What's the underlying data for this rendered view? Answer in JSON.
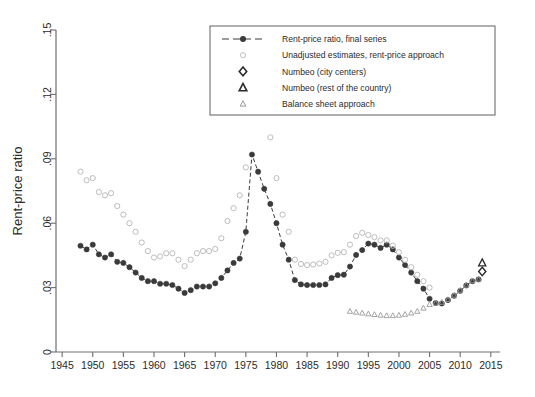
{
  "chart_data": {
    "type": "line",
    "title": "",
    "xlabel": "",
    "ylabel": "Rent-price ratio",
    "xlim": [
      1944,
      2016.5
    ],
    "ylim": [
      0,
      0.15
    ],
    "xticks": [
      1945,
      1950,
      1955,
      1960,
      1965,
      1970,
      1975,
      1980,
      1985,
      1990,
      1995,
      2000,
      2005,
      2010,
      2015
    ],
    "yticks": [
      0,
      0.03,
      0.06,
      0.09,
      0.12,
      0.15
    ],
    "ytick_labels": [
      "0",
      ".03",
      ".06",
      ".09",
      ".12",
      ".15"
    ],
    "grid": false,
    "legend_position": "top-right",
    "series": [
      {
        "name": "Rent-price ratio, final series",
        "marker": "filled-circle",
        "color": "#3a3a3a",
        "line": "dashed",
        "x": [
          1948,
          1949,
          1950,
          1951,
          1952,
          1953,
          1954,
          1955,
          1956,
          1957,
          1958,
          1959,
          1960,
          1961,
          1962,
          1963,
          1964,
          1965,
          1966,
          1967,
          1968,
          1969,
          1970,
          1971,
          1972,
          1973,
          1974,
          1975,
          1976,
          1977,
          1978,
          1979,
          1980,
          1981,
          1982,
          1983,
          1984,
          1985,
          1986,
          1987,
          1988,
          1989,
          1990,
          1991,
          1992,
          1993,
          1994,
          1995,
          1996,
          1997,
          1998,
          1999,
          2000,
          2001,
          2002,
          2003,
          2004,
          2005,
          2006,
          2007,
          2008,
          2009,
          2010,
          2011,
          2012,
          2013
        ],
        "values": [
          0.0495,
          0.0478,
          0.05,
          0.0455,
          0.044,
          0.0455,
          0.042,
          0.0415,
          0.0395,
          0.037,
          0.0345,
          0.033,
          0.033,
          0.0318,
          0.0318,
          0.0312,
          0.0295,
          0.0275,
          0.0288,
          0.0305,
          0.0305,
          0.0305,
          0.032,
          0.0345,
          0.038,
          0.0415,
          0.0435,
          0.056,
          0.092,
          0.084,
          0.076,
          0.069,
          0.06,
          0.05,
          0.043,
          0.0335,
          0.0315,
          0.0312,
          0.0312,
          0.0312,
          0.0315,
          0.0345,
          0.0358,
          0.036,
          0.0398,
          0.0452,
          0.0475,
          0.0505,
          0.05,
          0.0485,
          0.05,
          0.0478,
          0.044,
          0.0405,
          0.037,
          0.033,
          0.0295,
          0.0248,
          0.0228,
          0.0226,
          0.0242,
          0.0262,
          0.0285,
          0.031,
          0.033,
          0.0338
        ]
      },
      {
        "name": "Unadjusted estimates, rent-price approach",
        "marker": "hollow-circle",
        "color": "#bdbdbd",
        "line": "none",
        "x": [
          1948,
          1949,
          1950,
          1951,
          1952,
          1953,
          1954,
          1955,
          1956,
          1957,
          1958,
          1959,
          1960,
          1961,
          1962,
          1963,
          1964,
          1965,
          1966,
          1967,
          1968,
          1969,
          1970,
          1971,
          1972,
          1973,
          1974,
          1975,
          1976,
          1977,
          1978,
          1979,
          1980,
          1981,
          1982,
          1983,
          1984,
          1985,
          1986,
          1987,
          1988,
          1989,
          1990,
          1991,
          1992,
          1993,
          1994,
          1995,
          1996,
          1997,
          1998,
          1999,
          2000,
          2001,
          2002,
          2003,
          2004,
          2005
        ],
        "values": [
          0.084,
          0.08,
          0.081,
          0.0745,
          0.073,
          0.074,
          0.068,
          0.064,
          0.06,
          0.056,
          0.051,
          0.047,
          0.044,
          0.0445,
          0.046,
          0.046,
          0.043,
          0.04,
          0.043,
          0.046,
          0.047,
          0.047,
          0.048,
          0.053,
          0.061,
          0.067,
          0.073,
          0.086,
          0.1455,
          0.129,
          0.113,
          0.1,
          0.081,
          0.064,
          0.056,
          0.043,
          0.041,
          0.0405,
          0.0408,
          0.0412,
          0.042,
          0.045,
          0.0462,
          0.0465,
          0.05,
          0.054,
          0.0555,
          0.0545,
          0.0535,
          0.052,
          0.052,
          0.0495,
          0.0465,
          0.043,
          0.0395,
          0.036,
          0.033,
          0.03
        ]
      },
      {
        "name": "Balance sheet approach",
        "marker": "small-triangle",
        "color": "#9a9a9a",
        "line": "none",
        "x": [
          1992,
          1993,
          1994,
          1995,
          1996,
          1997,
          1998,
          1999,
          2000,
          2001,
          2002,
          2003,
          2004,
          2005,
          2006,
          2007,
          2008,
          2009,
          2010,
          2011,
          2012,
          2013
        ],
        "values": [
          0.019,
          0.0186,
          0.0182,
          0.0178,
          0.0175,
          0.0172,
          0.017,
          0.017,
          0.0172,
          0.0176,
          0.0182,
          0.019,
          0.0205,
          0.0222,
          0.0228,
          0.0232,
          0.0245,
          0.0265,
          0.0288,
          0.0312,
          0.0332,
          0.034
        ]
      },
      {
        "name": "Numbeo (city centers)",
        "marker": "hollow-diamond",
        "color": "#2b2b2b",
        "line": "none",
        "x": [
          2013.6
        ],
        "values": [
          0.0375
        ]
      },
      {
        "name": "Numbeo (rest of the country)",
        "marker": "hollow-triangle",
        "color": "#2b2b2b",
        "line": "none",
        "x": [
          2013.6
        ],
        "values": [
          0.0415
        ]
      }
    ]
  },
  "legend": {
    "items": [
      {
        "label": "Rent-price ratio, final series",
        "marker": "dashed-filled-circle"
      },
      {
        "label": "Unadjusted estimates, rent-price approach",
        "marker": "hollow-circle"
      },
      {
        "label": "Numbeo (city centers)",
        "marker": "hollow-diamond"
      },
      {
        "label": "Numbeo (rest of the country)",
        "marker": "hollow-triangle"
      },
      {
        "label": "Balance sheet approach",
        "marker": "small-triangle"
      }
    ]
  }
}
